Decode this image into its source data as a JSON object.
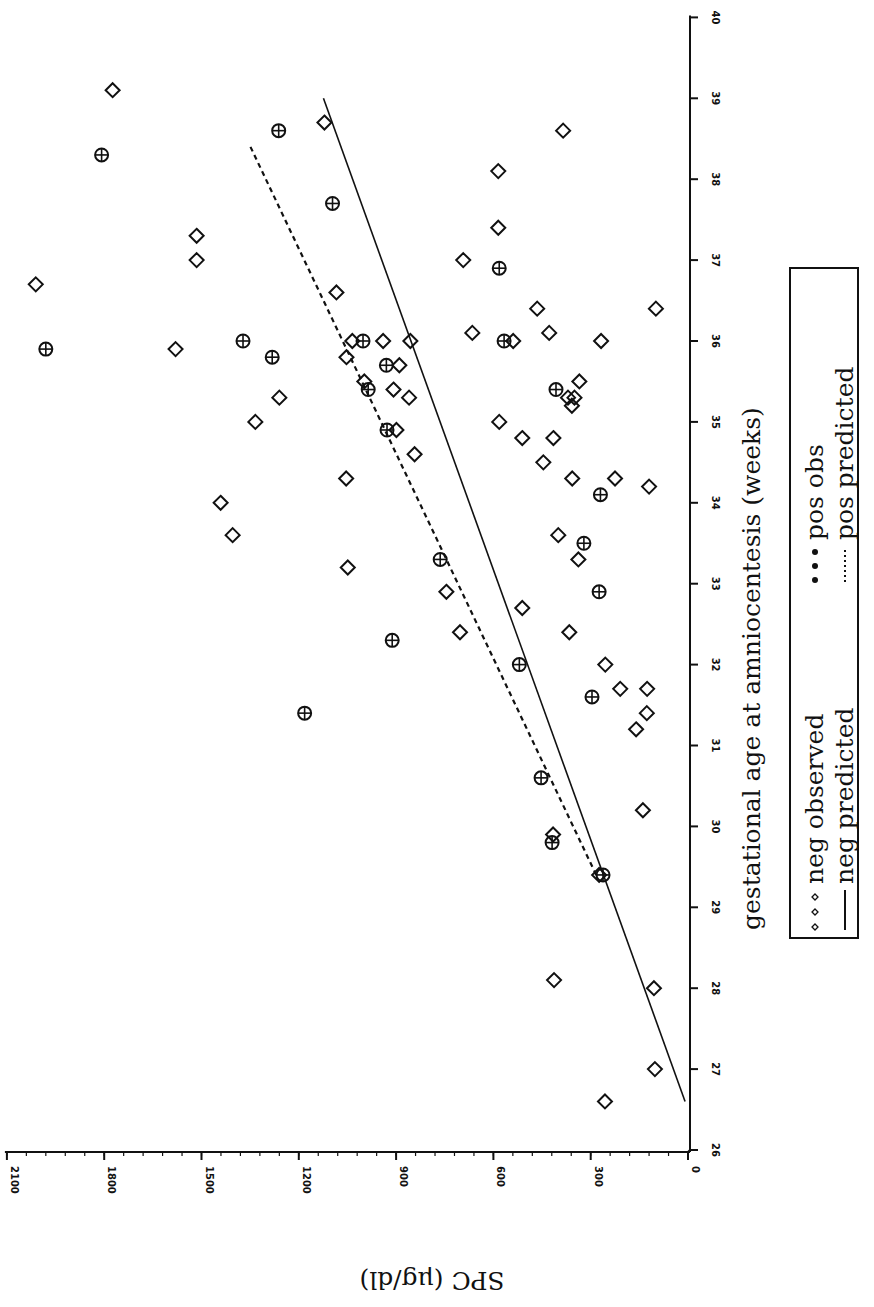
{
  "chart_data": {
    "type": "scatter",
    "title": "",
    "xlabel": "gestational age at amniocentesis (weeks)",
    "ylabel": "SPC (μg/dl)",
    "xlim": [
      26,
      40
    ],
    "ylim": [
      0,
      2100
    ],
    "x_ticks": [
      26,
      27,
      28,
      29,
      30,
      31,
      32,
      33,
      34,
      35,
      36,
      37,
      38,
      39,
      40
    ],
    "y_ticks": [
      0,
      300,
      600,
      900,
      1200,
      1500,
      1800,
      2100
    ],
    "grid": false,
    "orientation_note": "figure rotated 90° clockwise: weeks axis vertical on right, SPC axis horizontal at bottom increasing leftward",
    "legend": {
      "position": "right, below weeks-axis title",
      "entries": [
        {
          "label": "neg observed",
          "marker": "diamond"
        },
        {
          "label": "pos obs",
          "marker": "circle-plus"
        },
        {
          "label": "neg predicted",
          "line": "solid"
        },
        {
          "label": "pos predicted",
          "line": "dashed"
        }
      ]
    },
    "series": [
      {
        "name": "neg observed",
        "marker": "diamond",
        "points": [
          [
            39.1,
            1774
          ],
          [
            36.7,
            2011
          ],
          [
            38.7,
            1121
          ],
          [
            37.3,
            1515
          ],
          [
            37.0,
            1515
          ],
          [
            35.9,
            1580
          ],
          [
            34.0,
            1441
          ],
          [
            33.6,
            1404
          ],
          [
            35.0,
            1334
          ],
          [
            35.3,
            1260
          ],
          [
            36.6,
            1084
          ],
          [
            36.0,
            1035
          ],
          [
            36.0,
            940
          ],
          [
            36.0,
            856
          ],
          [
            35.8,
            1053
          ],
          [
            35.5,
            998
          ],
          [
            35.4,
            908
          ],
          [
            35.7,
            890
          ],
          [
            35.3,
            860
          ],
          [
            34.9,
            899
          ],
          [
            34.6,
            843
          ],
          [
            34.3,
            1054
          ],
          [
            33.2,
            1049
          ],
          [
            32.9,
            745
          ],
          [
            32.4,
            703
          ],
          [
            32.7,
            511
          ],
          [
            35.0,
            582
          ],
          [
            36.1,
            665
          ],
          [
            37.0,
            693
          ],
          [
            36.0,
            539
          ],
          [
            36.1,
            428
          ],
          [
            36.4,
            465
          ],
          [
            37.4,
            585
          ],
          [
            38.1,
            585
          ],
          [
            38.6,
            385
          ],
          [
            36.0,
            268
          ],
          [
            36.4,
            99
          ],
          [
            35.5,
            335
          ],
          [
            35.3,
            370
          ],
          [
            35.2,
            358
          ],
          [
            35.3,
            350
          ],
          [
            34.8,
            415
          ],
          [
            34.8,
            511
          ],
          [
            34.5,
            446
          ],
          [
            34.3,
            357
          ],
          [
            34.3,
            225
          ],
          [
            34.2,
            120
          ],
          [
            33.6,
            400
          ],
          [
            33.3,
            338
          ],
          [
            32.4,
            366
          ],
          [
            32.0,
            255
          ],
          [
            31.7,
            209
          ],
          [
            31.7,
            126
          ],
          [
            31.4,
            127
          ],
          [
            31.2,
            160
          ],
          [
            30.2,
            139
          ],
          [
            29.9,
            416
          ],
          [
            29.4,
            274
          ],
          [
            28.1,
            413
          ],
          [
            28.0,
            105
          ],
          [
            27.0,
            102
          ],
          [
            26.6,
            256
          ]
        ]
      },
      {
        "name": "pos obs",
        "marker": "circle-plus",
        "points": [
          [
            38.3,
            1808
          ],
          [
            35.9,
            1980
          ],
          [
            37.7,
            1096
          ],
          [
            38.6,
            1262
          ],
          [
            36.0,
            1372
          ],
          [
            35.8,
            1282
          ],
          [
            35.4,
            986
          ],
          [
            35.7,
            930
          ],
          [
            36.0,
            1002
          ],
          [
            34.9,
            928
          ],
          [
            36.0,
            567
          ],
          [
            36.9,
            582
          ],
          [
            35.4,
            407
          ],
          [
            34.1,
            270
          ],
          [
            33.5,
            321
          ],
          [
            33.3,
            764
          ],
          [
            32.9,
            274
          ],
          [
            32.3,
            912
          ],
          [
            31.6,
            296
          ],
          [
            31.4,
            1182
          ],
          [
            32.0,
            520
          ],
          [
            30.6,
            453
          ],
          [
            29.8,
            419
          ],
          [
            29.4,
            262
          ]
        ]
      },
      {
        "name": "neg predicted",
        "line": "solid",
        "points": [
          [
            26.6,
            9
          ],
          [
            39.0,
            1124
          ]
        ]
      },
      {
        "name": "pos predicted",
        "line": "dashed",
        "points": [
          [
            29.4,
            283
          ],
          [
            38.4,
            1349
          ]
        ]
      }
    ]
  },
  "axes": {
    "x_title": "gestational age at amniocentesis (weeks)",
    "y_title": "SPC (μg/dl)"
  }
}
